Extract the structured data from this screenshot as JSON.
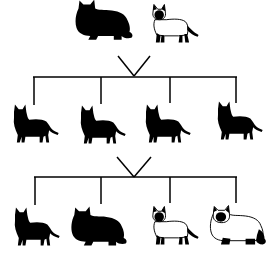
{
  "diagram": {
    "type": "inheritance-pedigree",
    "colors": {
      "ink": "#000000",
      "background": "#ffffff",
      "coat_light": "#ffffff"
    },
    "generations": [
      {
        "label": "parents",
        "cats": [
          {
            "id": "p1",
            "phenotype": "solid-black-longhair",
            "x": 104,
            "y": 30
          },
          {
            "id": "p2",
            "phenotype": "siamese-shorthair",
            "x": 170,
            "y": 30
          }
        ]
      },
      {
        "label": "F1",
        "cats": [
          {
            "id": "f1a",
            "phenotype": "solid-black-shorthair",
            "x": 34,
            "y": 125
          },
          {
            "id": "f1b",
            "phenotype": "solid-black-shorthair",
            "x": 101,
            "y": 125
          },
          {
            "id": "f1c",
            "phenotype": "solid-black-shorthair",
            "x": 168,
            "y": 125
          },
          {
            "id": "f1d",
            "phenotype": "solid-black-shorthair",
            "x": 236,
            "y": 123
          }
        ]
      },
      {
        "label": "F2",
        "cats": [
          {
            "id": "f2a",
            "phenotype": "solid-black-shorthair",
            "x": 34,
            "y": 228
          },
          {
            "id": "f2b",
            "phenotype": "solid-black-longhair",
            "x": 98,
            "y": 228
          },
          {
            "id": "f2c",
            "phenotype": "siamese-shorthair",
            "x": 170,
            "y": 228
          },
          {
            "id": "f2d",
            "phenotype": "siamese-longhair",
            "x": 236,
            "y": 228
          }
        ]
      }
    ]
  }
}
